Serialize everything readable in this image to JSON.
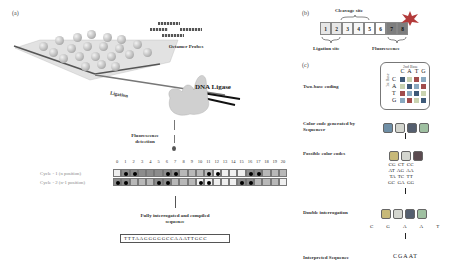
{
  "panel_a": {
    "letter": "(a)",
    "octamer_probes_label": "Octamer Probes",
    "ligation_label": "Ligation",
    "dna_ligase_label": "DNA Ligase",
    "fluorescence_detection_label": "Fluorescence detection",
    "cycle_indices": [
      "0",
      "1",
      "2",
      "3",
      "4",
      "5",
      "6",
      "7",
      "8",
      "9",
      "10",
      "11",
      "12",
      "13",
      "14",
      "15",
      "16",
      "17",
      "18",
      "19",
      "20"
    ],
    "cycle1_label": "Cycle - 1 (n position)",
    "cycle2_label": "Cycle - 2 (n-1 position)",
    "cycle1_cells": [
      {
        "shade": "light",
        "dot": false
      },
      {
        "shade": "dark",
        "dot": true
      },
      {
        "shade": "dark",
        "dot": true
      },
      {
        "shade": "dark",
        "dot": false
      },
      {
        "shade": "dark",
        "dot": false
      },
      {
        "shade": "dark",
        "dot": false
      },
      {
        "shade": "dark",
        "dot": true
      },
      {
        "shade": "dark",
        "dot": true
      },
      {
        "shade": "mid",
        "dot": false
      },
      {
        "shade": "mid",
        "dot": false
      },
      {
        "shade": "mid",
        "dot": false
      },
      {
        "shade": "mid",
        "dot": true
      },
      {
        "shade": "light",
        "dot": true
      },
      {
        "shade": "light",
        "dot": false
      },
      {
        "shade": "light",
        "dot": false
      },
      {
        "shade": "light",
        "dot": false
      },
      {
        "shade": "dark",
        "dot": true
      },
      {
        "shade": "dark",
        "dot": true
      },
      {
        "shade": "mid",
        "dot": false
      },
      {
        "shade": "mid",
        "dot": false
      },
      {
        "shade": "mid",
        "dot": false
      }
    ],
    "cycle2_cells": [
      {
        "shade": "dark",
        "dot": true
      },
      {
        "shade": "dark",
        "dot": true
      },
      {
        "shade": "mid",
        "dot": false
      },
      {
        "shade": "mid",
        "dot": false
      },
      {
        "shade": "mid",
        "dot": false
      },
      {
        "shade": "dark",
        "dot": true
      },
      {
        "shade": "dark",
        "dot": true
      },
      {
        "shade": "mid",
        "dot": false
      },
      {
        "shade": "mid",
        "dot": false
      },
      {
        "shade": "mid",
        "dot": false
      },
      {
        "shade": "light",
        "dot": true
      },
      {
        "shade": "light",
        "dot": true
      },
      {
        "shade": "light",
        "dot": false
      },
      {
        "shade": "light",
        "dot": false
      },
      {
        "shade": "light",
        "dot": false
      },
      {
        "shade": "dark",
        "dot": true
      },
      {
        "shade": "dark",
        "dot": true
      },
      {
        "shade": "mid",
        "dot": false
      },
      {
        "shade": "mid",
        "dot": false
      },
      {
        "shade": "mid",
        "dot": false
      },
      {
        "shade": "light",
        "dot": false
      }
    ],
    "compiled_label": "Fully interrogated and compiled sequence",
    "compiled_sequence": "TTTAAGGGGGCCAAATTGCC"
  },
  "panel_b": {
    "letter": "(b)",
    "cleavage_label": "Cleavage site",
    "ligation_site_label": "Ligation site",
    "fluorescence_label": "Fluorescence",
    "probe_positions": [
      "1",
      "2",
      "3",
      "4",
      "5",
      "6",
      "7",
      "8"
    ]
  },
  "panel_c": {
    "letter": "(c)",
    "two_base_label": "Two-base coding",
    "second_base_label": "2nd Base",
    "first_base_label": "1st Base",
    "bases": [
      "C",
      "A",
      "T",
      "G"
    ],
    "matrix_colors": [
      [
        "#3e5a78",
        "#c9d3b0",
        "#a14c4c",
        "#89a9c0"
      ],
      [
        "#c9d3b0",
        "#3e5a78",
        "#89a9c0",
        "#a14c4c"
      ],
      [
        "#a14c4c",
        "#89a9c0",
        "#3e5a78",
        "#c9d3b0"
      ],
      [
        "#89a9c0",
        "#a14c4c",
        "#c9d3b0",
        "#3e5a78"
      ]
    ],
    "color_code_label": "Color code generated by Sequencer",
    "possible_codes_label": "Possible color codes",
    "possible_codes": [
      [
        "CG",
        "CT",
        "CC"
      ],
      [
        "AT",
        "AG",
        "AA"
      ],
      [
        "TA",
        "TC",
        "TT"
      ],
      [
        "GC",
        "GA",
        "GG"
      ]
    ],
    "double_interrogation_label": "Double interrogation",
    "double_letters": [
      "C",
      "G",
      "A",
      "A",
      "T"
    ],
    "interpreted_label": "Interpreted Sequence",
    "interpreted_sequence": "CGAAT"
  }
}
